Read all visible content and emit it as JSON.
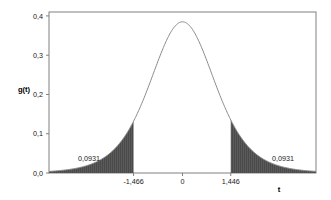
{
  "chart_data": {
    "type": "area",
    "title": "",
    "subtitle": "",
    "xlabel": "t",
    "ylabel": "g(t)",
    "xlim": [
      -4.0,
      4.0
    ],
    "ylim": [
      0.0,
      0.41
    ],
    "grid": false,
    "legend": null,
    "decimal_separator": ",",
    "curve": {
      "name": "g(t)",
      "description": "Student t probability density curve",
      "peak_x": 0,
      "peak_y": 0.385,
      "line_color": "#8a8a8a",
      "x": [
        -4.0,
        -3.75,
        -3.5,
        -3.25,
        -3.0,
        -2.75,
        -2.5,
        -2.25,
        -2.0,
        -1.75,
        -1.5,
        -1.25,
        -1.0,
        -0.75,
        -0.5,
        -0.25,
        0.0,
        0.25,
        0.5,
        0.75,
        1.0,
        1.25,
        1.5,
        1.75,
        2.0,
        2.25,
        2.5,
        2.75,
        3.0,
        3.25,
        3.5,
        3.75,
        4.0
      ],
      "y": [
        0.0037,
        0.0056,
        0.0084,
        0.0125,
        0.0183,
        0.0264,
        0.0372,
        0.0511,
        0.0684,
        0.0889,
        0.1123,
        0.1377,
        0.164,
        0.1895,
        0.2126,
        0.2315,
        0.245,
        0.2315,
        0.2126,
        0.1895,
        0.164,
        0.1377,
        0.1123,
        0.0889,
        0.0684,
        0.0511,
        0.0372,
        0.0264,
        0.0183,
        0.0125,
        0.0084,
        0.0056,
        0.0037
      ]
    },
    "x_ticks": [
      {
        "value": -1.466,
        "label": "-1,466"
      },
      {
        "value": 0,
        "label": "0"
      },
      {
        "value": 1.446,
        "label": "1,446"
      }
    ],
    "y_ticks": [
      {
        "value": 0.0,
        "label": "0,0"
      },
      {
        "value": 0.1,
        "label": "0,1"
      },
      {
        "value": 0.2,
        "label": "0,2"
      },
      {
        "value": 0.3,
        "label": "0,3"
      },
      {
        "value": 0.4,
        "label": "0,4"
      }
    ],
    "shaded_regions": [
      {
        "name": "left-tail",
        "from": -4.0,
        "to": -1.466,
        "area_label": "0,0931",
        "area_value": 0.0931,
        "fill_color": "#555555"
      },
      {
        "name": "right-tail",
        "from": 1.446,
        "to": 4.0,
        "area_label": "0,0931",
        "area_value": 0.0931,
        "fill_color": "#555555"
      }
    ],
    "frame_color": "#808080",
    "background_color": "#ffffff"
  },
  "axes": {
    "y_label": "g(t)",
    "x_label": "t"
  },
  "annotations": {
    "left_area": "0,0931",
    "right_area": "0,0931"
  }
}
